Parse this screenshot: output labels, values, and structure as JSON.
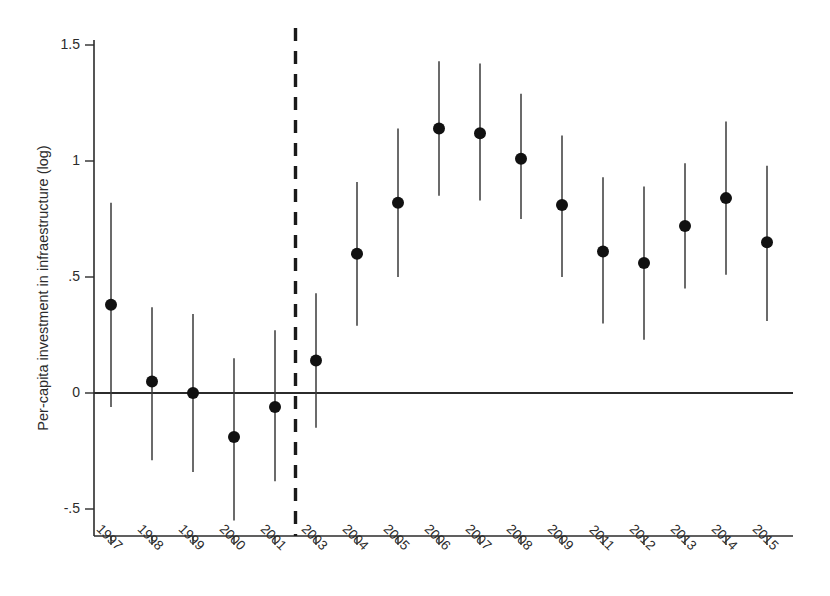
{
  "chart_data": {
    "type": "scatter",
    "title": "",
    "subtitle": "",
    "xlabel": "",
    "ylabel": "Per-capita investment in infraestructure (log)",
    "categories": [
      "1997",
      "1998",
      "1999",
      "2000",
      "2001",
      "2003",
      "2004",
      "2005",
      "2006",
      "2007",
      "2008",
      "2009",
      "2011",
      "2012",
      "2013",
      "2014",
      "2015"
    ],
    "values": [
      0.38,
      0.05,
      0.0,
      -0.19,
      -0.06,
      0.14,
      0.6,
      0.82,
      1.14,
      1.12,
      1.01,
      0.81,
      0.61,
      0.56,
      0.72,
      0.84,
      0.65
    ],
    "ci_low": [
      -0.06,
      -0.29,
      -0.34,
      -0.55,
      -0.38,
      -0.15,
      0.29,
      0.5,
      0.85,
      0.83,
      0.75,
      0.5,
      0.3,
      0.23,
      0.45,
      0.51,
      0.31
    ],
    "ci_high": [
      0.82,
      0.37,
      0.34,
      0.15,
      0.27,
      0.43,
      0.91,
      1.14,
      1.43,
      1.42,
      1.29,
      1.11,
      0.93,
      0.89,
      0.99,
      1.17,
      0.98
    ],
    "series": [
      {
        "name": "Point estimate with 95% confidence interval",
        "values": [
          0.38,
          0.05,
          0.0,
          -0.19,
          -0.06,
          0.14,
          0.6,
          0.82,
          1.14,
          1.12,
          1.01,
          0.81,
          0.61,
          0.56,
          0.72,
          0.84,
          0.65
        ]
      }
    ],
    "ytick_labels": [
      "1.5",
      "1",
      ".5",
      "0",
      "-.5"
    ],
    "ytick_values": [
      1.5,
      1.0,
      0.5,
      0.0,
      -0.5
    ],
    "ylim": [
      -0.62,
      1.58
    ],
    "grid": false,
    "legend": "none",
    "reference_line": {
      "orientation": "vertical",
      "between": [
        "2001",
        "2003"
      ],
      "style": "dashed",
      "color": "#1a1a1a"
    },
    "zero_line": {
      "orientation": "horizontal",
      "value": 0,
      "style": "solid",
      "color": "#2b2b2b"
    },
    "marker": {
      "shape": "circle",
      "color": "#111111",
      "size": 6
    },
    "annotations": []
  },
  "figure": {
    "background_color": "#ffffff",
    "axis_color": "#2b2b2b",
    "accent_color": "#111111"
  }
}
